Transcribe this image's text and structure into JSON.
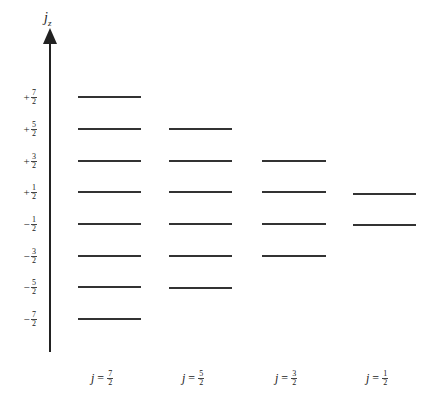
{
  "axis": {
    "label": "j",
    "label_sub": "z",
    "ticks": [
      {
        "sign": "+",
        "num": "7",
        "den": "2",
        "y": 97
      },
      {
        "sign": "+",
        "num": "5",
        "den": "2",
        "y": 129
      },
      {
        "sign": "+",
        "num": "3",
        "den": "2",
        "y": 161
      },
      {
        "sign": "+",
        "num": "1",
        "den": "2",
        "y": 192
      },
      {
        "sign": "−",
        "num": "1",
        "den": "2",
        "y": 224
      },
      {
        "sign": "−",
        "num": "3",
        "den": "2",
        "y": 256
      },
      {
        "sign": "−",
        "num": "5",
        "den": "2",
        "y": 287
      },
      {
        "sign": "−",
        "num": "7",
        "den": "2",
        "y": 319
      }
    ]
  },
  "columns": [
    {
      "j_label": "j",
      "eq": "=",
      "num": "7",
      "den": "2",
      "x1": 78,
      "x2": 141,
      "levels": [
        97,
        129,
        161,
        192,
        224,
        256,
        287,
        319
      ]
    },
    {
      "j_label": "j",
      "eq": "=",
      "num": "5",
      "den": "2",
      "x1": 169,
      "x2": 232,
      "levels": [
        129,
        161,
        192,
        224,
        256,
        288
      ]
    },
    {
      "j_label": "j",
      "eq": "=",
      "num": "3",
      "den": "2",
      "x1": 262,
      "x2": 326,
      "levels": [
        161,
        192,
        224,
        256
      ]
    },
    {
      "j_label": "j",
      "eq": "=",
      "num": "1",
      "den": "2",
      "x1": 353,
      "x2": 416,
      "levels": [
        194,
        225
      ]
    }
  ]
}
